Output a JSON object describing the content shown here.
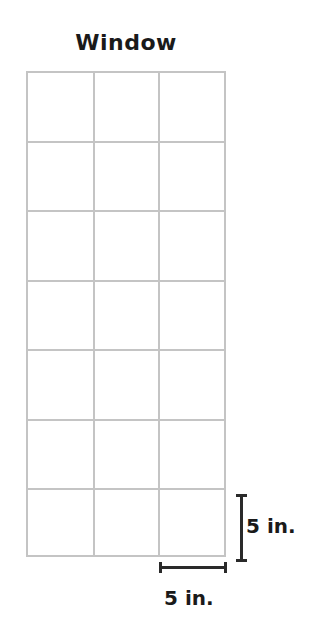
{
  "diagram": {
    "title": "Window",
    "grid": {
      "columns": 3,
      "rows": 7,
      "line_color": "#c4c4c4"
    },
    "dimensions": {
      "height_label": "5 in.",
      "width_label": "5 in."
    }
  }
}
